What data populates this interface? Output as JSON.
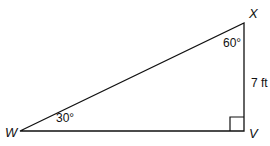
{
  "diagram": {
    "type": "right-triangle",
    "vertices": {
      "W": "W",
      "X": "X",
      "V": "V"
    },
    "angles": {
      "W": "30°",
      "X": "60°",
      "V": "90° (right angle)"
    },
    "side_labels": {
      "XV": "7 ft"
    },
    "stroke_color": "#111111"
  }
}
